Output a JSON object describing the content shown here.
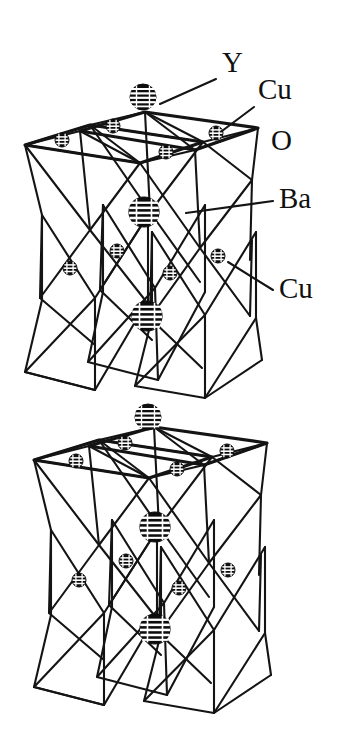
{
  "figure": {
    "kind": "crystal-structure-diagram",
    "background_color": "#ffffff",
    "line_color": "#141414",
    "atom_color": "#0d0d0d",
    "atom_highlight_color": "#ffffff",
    "width": 346,
    "height": 750
  },
  "labels": [
    {
      "id": "y",
      "text": "Y",
      "x": 222,
      "y": 72,
      "leader": {
        "x1": 216,
        "y1": 79,
        "x2": 160,
        "y2": 104
      }
    },
    {
      "id": "cu-top",
      "text": "Cu",
      "x": 258,
      "y": 99,
      "leader": {
        "x1": 254,
        "y1": 107,
        "x2": 222,
        "y2": 131
      }
    },
    {
      "id": "o",
      "text": "O",
      "x": 271,
      "y": 150,
      "leader": null
    },
    {
      "id": "ba",
      "text": "Ba",
      "x": 279,
      "y": 208,
      "leader": {
        "x1": 273,
        "y1": 201,
        "x2": 186,
        "y2": 213
      }
    },
    {
      "id": "cu-bot",
      "text": "Cu",
      "x": 279,
      "y": 298,
      "leader": {
        "x1": 273,
        "y1": 290,
        "x2": 228,
        "y2": 262
      }
    }
  ],
  "atoms": {
    "legend": [
      {
        "species": "Y",
        "size": "large",
        "radius": 13,
        "pattern": "horizontal-stripes"
      },
      {
        "species": "Ba",
        "size": "large",
        "radius": 15,
        "pattern": "horizontal-stripes"
      },
      {
        "species": "Cu",
        "size": "small",
        "radius": 7,
        "pattern": "horizontal-stripes"
      },
      {
        "species": "O",
        "size": "vertex",
        "radius": 0,
        "pattern": "none"
      }
    ],
    "positions": [
      {
        "species": "Y",
        "cx": 143,
        "cy": 97,
        "r": 13
      },
      {
        "species": "Cu",
        "cx": 113,
        "cy": 126,
        "r": 7
      },
      {
        "species": "Cu",
        "cx": 62,
        "cy": 140,
        "r": 7
      },
      {
        "species": "Cu",
        "cx": 216,
        "cy": 133,
        "r": 7
      },
      {
        "species": "Cu",
        "cx": 166,
        "cy": 152,
        "r": 7
      },
      {
        "species": "Ba",
        "cx": 144,
        "cy": 212,
        "r": 15
      },
      {
        "species": "Cu",
        "cx": 70,
        "cy": 268,
        "r": 7
      },
      {
        "species": "Cu",
        "cx": 117,
        "cy": 251,
        "r": 7
      },
      {
        "species": "Cu",
        "cx": 170,
        "cy": 273,
        "r": 7
      },
      {
        "species": "Cu",
        "cx": 218,
        "cy": 256,
        "r": 7
      },
      {
        "species": "Ba",
        "cx": 147,
        "cy": 316,
        "r": 15
      },
      {
        "species": "Y",
        "cx": 148,
        "cy": 417,
        "r": 13
      },
      {
        "species": "Cu",
        "cx": 125,
        "cy": 443,
        "r": 7
      },
      {
        "species": "Cu",
        "cx": 76,
        "cy": 461,
        "r": 7
      },
      {
        "species": "Cu",
        "cx": 227,
        "cy": 451,
        "r": 7
      },
      {
        "species": "Cu",
        "cx": 177,
        "cy": 469,
        "r": 7
      },
      {
        "species": "Ba",
        "cx": 155,
        "cy": 527,
        "r": 15
      },
      {
        "species": "Cu",
        "cx": 79,
        "cy": 580,
        "r": 7
      },
      {
        "species": "Cu",
        "cx": 126,
        "cy": 561,
        "r": 7
      },
      {
        "species": "Cu",
        "cx": 179,
        "cy": 588,
        "r": 7
      },
      {
        "species": "Cu",
        "cx": 228,
        "cy": 570,
        "r": 7
      },
      {
        "species": "Ba",
        "cx": 155,
        "cy": 629,
        "r": 15
      }
    ]
  }
}
